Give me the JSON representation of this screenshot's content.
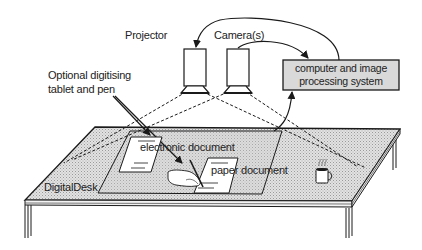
{
  "diagram": {
    "title": "DigitalDesk",
    "labels": {
      "projector": "Projector",
      "cameras": "Camera(s)",
      "computer_line1": "computer and image",
      "computer_line2": "processing system",
      "tablet_line1": "Optional digitising",
      "tablet_line2": "tablet and pen",
      "electronic_document": "electronic document",
      "paper_document": "paper document",
      "desk": "DigitalDesk"
    },
    "nodes": [
      {
        "id": "projector",
        "label": "Projector",
        "shape": "box-with-lens"
      },
      {
        "id": "camera",
        "label": "Camera(s)",
        "shape": "box-with-lens"
      },
      {
        "id": "computer",
        "label": "computer and image processing system",
        "shape": "rect",
        "fill": "#d8d8d8"
      },
      {
        "id": "desk",
        "label": "DigitalDesk",
        "shape": "table"
      },
      {
        "id": "tablet",
        "label": "Optional digitising tablet and pen",
        "shape": "parallelogram"
      },
      {
        "id": "electronic_document",
        "label": "electronic document",
        "shape": "sheet"
      },
      {
        "id": "paper_document",
        "label": "paper document",
        "shape": "sheet"
      },
      {
        "id": "hand_pen",
        "label": "",
        "shape": "hand-with-pen"
      },
      {
        "id": "coffee_mug",
        "label": "",
        "shape": "mug"
      }
    ],
    "edges": [
      {
        "from": "computer",
        "to": "projector",
        "style": "curved-arrow"
      },
      {
        "from": "camera",
        "to": "computer",
        "style": "curved-arrow"
      },
      {
        "from": "tablet",
        "to": "computer",
        "style": "arrow"
      },
      {
        "from": "tablet_label",
        "to": "tablet",
        "style": "pointer-arrow"
      },
      {
        "from": "tablet_label",
        "to": "hand_pen",
        "style": "pointer-arrow"
      },
      {
        "from": "projector",
        "to": "desk",
        "style": "dashed-projection"
      },
      {
        "from": "camera",
        "to": "desk",
        "style": "dashed-projection"
      }
    ],
    "colors": {
      "ink": "#1a1a1a",
      "desk_fill": "#cfcfcf",
      "box_fill": "#d9d9d9",
      "paper": "#ffffff"
    }
  }
}
